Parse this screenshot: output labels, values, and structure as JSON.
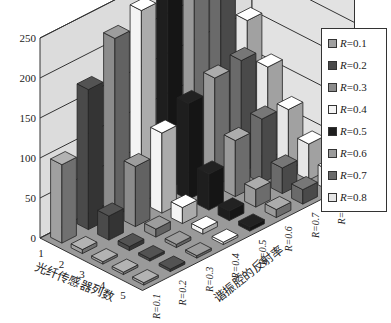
{
  "chart_data": {
    "type": "bar3d",
    "title": "",
    "xlabel": "光纤传感器列数",
    "ylabel": "谐振腔的反射率",
    "zlabel": "",
    "zlim": [
      0,
      250
    ],
    "z_ticks": [
      "0",
      "50",
      "100",
      "150",
      "200",
      "250"
    ],
    "x_categories": [
      "1",
      "2",
      "3",
      "4",
      "5"
    ],
    "y_categories": [
      "R=0.1",
      "R=0.2",
      "R=0.3",
      "R=0.4",
      "R=0.5",
      "R=0.6",
      "R=0.7",
      "R=0.8"
    ],
    "legend_position": "right",
    "grid": true,
    "series": [
      {
        "name": "R=0.1",
        "color": "#a0a0a0",
        "values": [
          98,
          5,
          2,
          1,
          0
        ]
      },
      {
        "name": "R=0.2",
        "color": "#4a4a4a",
        "values": [
          175,
          30,
          5,
          2,
          1
        ]
      },
      {
        "name": "R=0.3",
        "color": "#8c8c8c",
        "values": [
          222,
          75,
          10,
          4,
          2
        ]
      },
      {
        "name": "R=0.4",
        "color": "#f4f4f4",
        "values": [
          240,
          100,
          20,
          6,
          3
        ]
      },
      {
        "name": "R=0.5",
        "color": "#1e1e1e",
        "values": [
          250,
          120,
          45,
          12,
          5
        ]
      },
      {
        "name": "R=0.6",
        "color": "#9a9a9a",
        "values": [
          235,
          135,
          70,
          22,
          10
        ]
      },
      {
        "name": "R=0.7",
        "color": "#6a6a6a",
        "values": [
          205,
          140,
          80,
          32,
          18
        ]
      },
      {
        "name": "R=0.8",
        "color": "#e6e6e6",
        "values": [
          160,
          115,
          75,
          45,
          25
        ]
      }
    ]
  },
  "legend": {
    "items": [
      {
        "prefix": "R",
        "value": "=0.1",
        "color": "#a0a0a0"
      },
      {
        "prefix": "R",
        "value": "=0.2",
        "color": "#4a4a4a"
      },
      {
        "prefix": "R",
        "value": "=0.3",
        "color": "#8c8c8c"
      },
      {
        "prefix": "R",
        "value": "=0.4",
        "color": "#f4f4f4"
      },
      {
        "prefix": "R",
        "value": "=0.5",
        "color": "#1e1e1e"
      },
      {
        "prefix": "R",
        "value": "=0.6",
        "color": "#9a9a9a"
      },
      {
        "prefix": "R",
        "value": "=0.7",
        "color": "#6a6a6a"
      },
      {
        "prefix": "R",
        "value": "=0.8",
        "color": "#e6e6e6"
      }
    ]
  }
}
